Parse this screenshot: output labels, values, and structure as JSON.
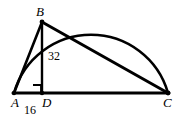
{
  "figure": {
    "kind": "geometry-diagram",
    "background_color": "#ffffff",
    "stroke_color": "#000000",
    "labels": {
      "vertex_a": "A",
      "vertex_b": "B",
      "vertex_d": "D",
      "vertex_c": "C",
      "segment_ad": "16",
      "segment_bd": "32"
    },
    "icons": {
      "right_angle_marker": "right-angle-icon"
    },
    "points": {
      "A": {
        "x": 14,
        "y": 93
      },
      "D": {
        "x": 42,
        "y": 93
      },
      "C": {
        "x": 168,
        "y": 93
      },
      "B": {
        "x": 42,
        "y": 22
      }
    },
    "semicircle": {
      "center_x": 91,
      "center_y": 93,
      "radius": 80,
      "start_x": 14,
      "start_y": 93,
      "end_x": 168,
      "end_y": 93
    },
    "segments": [
      {
        "name": "AC",
        "from": "A",
        "to": "C"
      },
      {
        "name": "AB",
        "from": "A",
        "to": "B"
      },
      {
        "name": "BD",
        "from": "B",
        "to": "D"
      },
      {
        "name": "BC",
        "from": "B",
        "to": "C"
      }
    ]
  }
}
